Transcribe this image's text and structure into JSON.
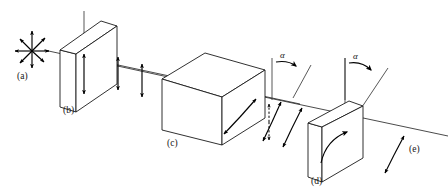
{
  "figure": {
    "kind": "optics-ray-diagram",
    "background_color": "#ffffff",
    "line_color": "#1a1a1a",
    "text_color": "#161616"
  },
  "labels": {
    "a": "(a)",
    "b": "(b)",
    "c": "(c)",
    "d": "(d)",
    "e": "(e)"
  },
  "angles": {
    "first": "α",
    "second": "α"
  },
  "components": [
    {
      "id": "a",
      "label": "(a)",
      "name": "unpolarized-light-source",
      "description": "Radial star of eight double-headed arrows representing unpolarized light",
      "arrow_count": 8
    },
    {
      "id": "b",
      "label": "(b)",
      "name": "polarizer-plate",
      "description": "Thin rectangular plate in isometric view with vertical transmission axis"
    },
    {
      "id": "c",
      "label": "(c)",
      "name": "rotator-cube",
      "description": "Cube element that rotates the plane of polarization"
    },
    {
      "id": "d",
      "label": "(d)",
      "name": "analyzer-plate",
      "description": "Thin rectangular plate in isometric view with rotation arc arrow"
    },
    {
      "id": "e",
      "label": "(e)",
      "name": "output-beam",
      "description": "Transmitted beam with tilted double-headed polarization arrow"
    }
  ],
  "polarization_markers": [
    {
      "name": "unpolarized-star",
      "style": "radial-double-arrows",
      "segment": "before-b"
    },
    {
      "name": "vertical-polarization-1",
      "style": "vertical-double-arrow",
      "segment": "b-to-c"
    },
    {
      "name": "vertical-polarization-2",
      "style": "vertical-double-arrow",
      "segment": "b-to-c"
    },
    {
      "name": "vertical-polarization-3",
      "style": "vertical-double-arrow",
      "segment": "b-to-c"
    },
    {
      "name": "vertical-polarization-4",
      "style": "vertical-double-arrow",
      "segment": "b-to-c"
    },
    {
      "name": "tilted-polarization-in-cube",
      "style": "tilted-double-arrow",
      "segment": "inside-c"
    },
    {
      "name": "reference-vertical-dashed",
      "style": "dashed-vertical-double-arrow",
      "segment": "c-to-d"
    },
    {
      "name": "rotated-polarization-1",
      "style": "tilted-double-arrow",
      "segment": "c-to-d"
    },
    {
      "name": "rotated-polarization-2",
      "style": "tilted-double-arrow",
      "segment": "c-to-d"
    },
    {
      "name": "output-polarization",
      "style": "tilted-double-arrow",
      "segment": "after-d"
    }
  ]
}
